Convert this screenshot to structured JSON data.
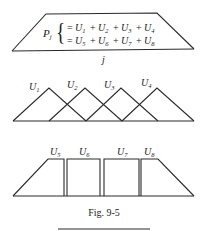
{
  "figure": {
    "caption": "Fig. 9-5",
    "top_panel": {
      "lhs": "P",
      "lhs_sub": "j",
      "row1": [
        {
          "sym": "U",
          "sub": "1"
        },
        {
          "sym": "U",
          "sub": "2"
        },
        {
          "sym": "U",
          "sub": "3"
        },
        {
          "sym": "U",
          "sub": "4"
        }
      ],
      "row2": [
        {
          "sym": "U",
          "sub": "5"
        },
        {
          "sym": "U",
          "sub": "6"
        },
        {
          "sym": "U",
          "sub": "7"
        },
        {
          "sym": "U",
          "sub": "8"
        }
      ],
      "eq": "=",
      "plus": "+",
      "brace": "{",
      "axis_label": "j"
    },
    "middle_panel": {
      "description": "Four overlapping triangular shape functions",
      "labels": [
        {
          "sym": "U",
          "sub": "1"
        },
        {
          "sym": "U",
          "sub": "2"
        },
        {
          "sym": "U",
          "sub": "3"
        },
        {
          "sym": "U",
          "sub": "4"
        }
      ]
    },
    "bottom_panel": {
      "description": "Four adjacent rectangular/trapezoidal blocks",
      "labels": [
        {
          "sym": "U",
          "sub": "5"
        },
        {
          "sym": "U",
          "sub": "6"
        },
        {
          "sym": "U",
          "sub": "7"
        },
        {
          "sym": "U",
          "sub": "8"
        }
      ]
    }
  }
}
